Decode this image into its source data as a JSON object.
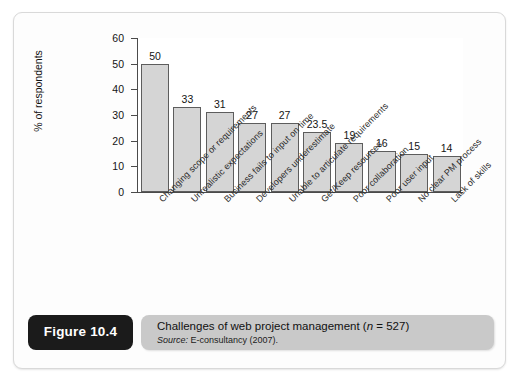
{
  "figure": {
    "tab_label": "Figure 10.4",
    "caption_title_before_n": "Challenges of web project management (",
    "caption_title_n": "n",
    "caption_title_after_n": " = 527)",
    "caption_source_label": "Source:",
    "caption_source_text": " E-consultancy (2007)."
  },
  "chart_data": {
    "type": "bar",
    "title": "",
    "xlabel": "",
    "ylabel": "% of respondents",
    "ylim": [
      0,
      60
    ],
    "yticks": [
      0,
      10,
      20,
      30,
      40,
      50,
      60
    ],
    "grid": false,
    "legend": "none",
    "categories": [
      "Changing scope or requirements",
      "Unrealistic expectations",
      "Business fails to input on time",
      "Developers underestimate",
      "Unable to articulate requirements",
      "Get/Keep resources",
      "Poor collaboration",
      "Poor user input",
      "No clear PM process",
      "Lack of skills"
    ],
    "values": [
      50,
      33,
      31,
      27,
      27,
      23.5,
      19,
      16,
      15,
      14
    ],
    "value_labels": [
      "50",
      "33",
      "31",
      "27",
      "27",
      "23.5",
      "19",
      "16",
      "15",
      "14"
    ],
    "bar_color": "#d5d5d5",
    "bar_edge_color": "#5d5d5d",
    "axis_color": "#4a4a4a",
    "plot_background": "#ffffff"
  }
}
